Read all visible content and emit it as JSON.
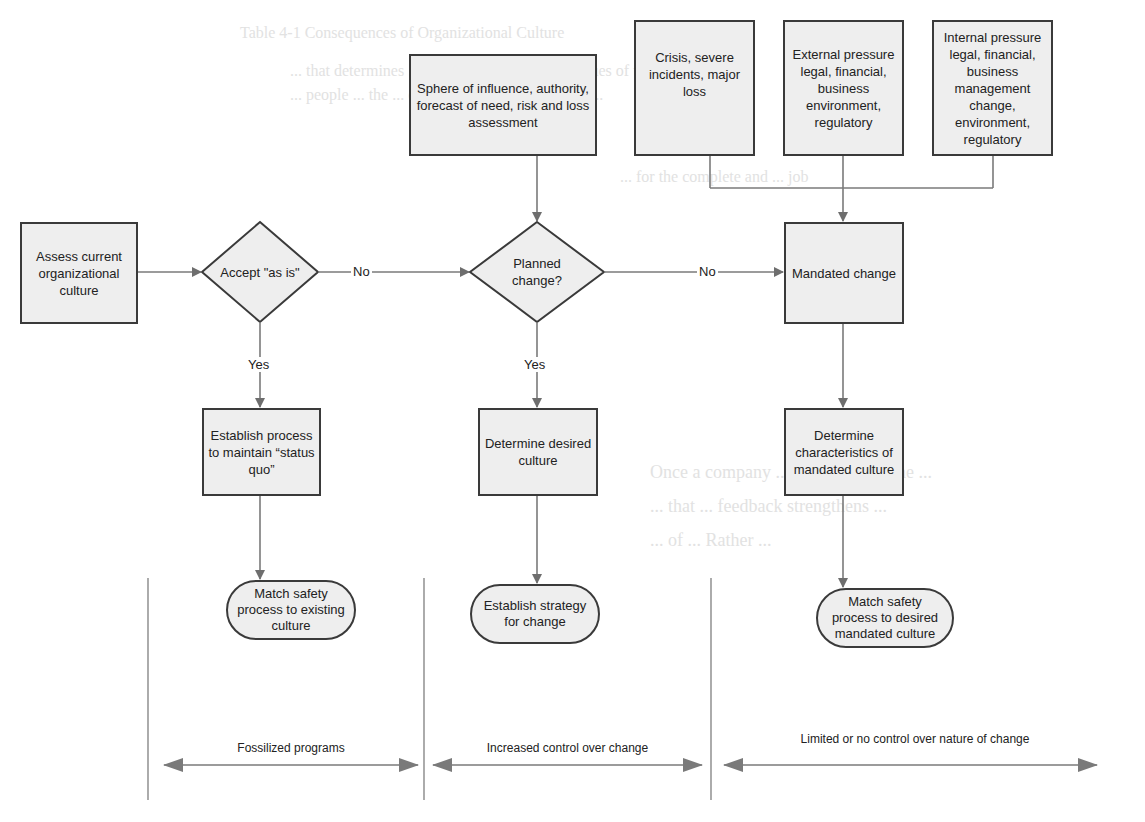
{
  "background_text": {
    "title_fragment": "Table 4-1 Consequences of Organizational Culture",
    "lines": [
      "... that determines ... the organization ... the values of the ...",
      "... people ... the ... of ... around ... and ... called ...",
      "... for the complete and ... job",
      "Once a company ... in favor of ... the ...",
      "... that ... feedback strengthens ...",
      "... of ... Rather ..."
    ]
  },
  "nodes": {
    "assess": "Assess current organizational culture",
    "accept_decision": "Accept \"as is\"",
    "planned_decision": "Planned change?",
    "sphere": "Sphere of influence, authority, forecast of need, risk and loss assessment",
    "crisis": "Crisis, severe incidents, major loss",
    "external": "External pressure legal, financial, business environment, regulatory",
    "internal": "Internal pressure legal, financial, business management change, environment, regulatory",
    "mandated": "Mandated change",
    "establish_process": "Establish process to maintain “status quo”",
    "determine_desired": "Determine desired culture",
    "determine_characteristics": "Determine characteristics of mandated culture",
    "match_existing": "Match safety process to existing culture",
    "establish_strategy": "Establish strategy for change",
    "match_mandated": "Match safety process to desired mandated culture"
  },
  "edge_labels": {
    "accept_no": "No",
    "planned_no": "No",
    "accept_yes": "Yes",
    "planned_yes": "Yes"
  },
  "bands": {
    "fossilized": "Fossilized programs",
    "increased": "Increased control over change",
    "limited": "Limited or no control over nature of change"
  },
  "colors": {
    "node_fill": "#eeeeee",
    "node_border": "#3a3a3a",
    "connector": "#7a7a7a",
    "arrowhead": "#6e6e6e"
  }
}
